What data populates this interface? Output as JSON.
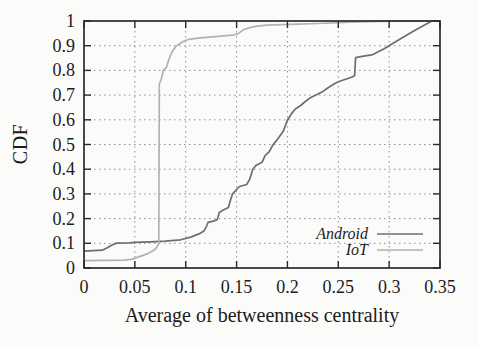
{
  "figure": {
    "background": "#fbfbfa"
  },
  "chart_data": {
    "type": "line",
    "subtype": "cdf-step-curves",
    "title": "",
    "xlabel": "Average of betweenness centrality",
    "ylabel": "CDF",
    "xlim": [
      0,
      0.35
    ],
    "ylim": [
      0,
      1
    ],
    "x_ticks": [
      0,
      0.05,
      0.1,
      0.15,
      0.2,
      0.25,
      0.3,
      0.35
    ],
    "x_tick_labels": [
      "0",
      "0.05",
      "0.1",
      "0.15",
      "0.2",
      "0.25",
      "0.3",
      "0.35"
    ],
    "y_ticks": [
      0,
      0.1,
      0.2,
      0.3,
      0.4,
      0.5,
      0.6,
      0.7,
      0.8,
      0.9,
      1
    ],
    "y_tick_labels": [
      "0",
      "0.1",
      "0.2",
      "0.3",
      "0.4",
      "0.5",
      "0.6",
      "0.7",
      "0.8",
      "0.9",
      "1"
    ],
    "grid": true,
    "grid_style": "dotted",
    "legend_position": "inside-lower-right",
    "frame_color": "#2b2b2b",
    "grid_color": "#8f8f8f",
    "legend": {
      "entries": [
        {
          "label": "Android"
        },
        {
          "label": "IoT"
        }
      ]
    },
    "series": [
      {
        "name": "Android",
        "color": "#6e6e6e",
        "points": [
          [
            0,
            0.068
          ],
          [
            0.018,
            0.072
          ],
          [
            0.023,
            0.082
          ],
          [
            0.027,
            0.092
          ],
          [
            0.032,
            0.101
          ],
          [
            0.045,
            0.102
          ],
          [
            0.05,
            0.104
          ],
          [
            0.065,
            0.106
          ],
          [
            0.08,
            0.109
          ],
          [
            0.095,
            0.114
          ],
          [
            0.105,
            0.125
          ],
          [
            0.113,
            0.138
          ],
          [
            0.118,
            0.15
          ],
          [
            0.12,
            0.165
          ],
          [
            0.122,
            0.185
          ],
          [
            0.127,
            0.19
          ],
          [
            0.131,
            0.195
          ],
          [
            0.133,
            0.225
          ],
          [
            0.137,
            0.235
          ],
          [
            0.142,
            0.245
          ],
          [
            0.144,
            0.275
          ],
          [
            0.146,
            0.3
          ],
          [
            0.15,
            0.318
          ],
          [
            0.153,
            0.33
          ],
          [
            0.16,
            0.338
          ],
          [
            0.163,
            0.36
          ],
          [
            0.166,
            0.4
          ],
          [
            0.169,
            0.415
          ],
          [
            0.175,
            0.428
          ],
          [
            0.178,
            0.455
          ],
          [
            0.182,
            0.47
          ],
          [
            0.186,
            0.5
          ],
          [
            0.19,
            0.52
          ],
          [
            0.196,
            0.555
          ],
          [
            0.2,
            0.598
          ],
          [
            0.204,
            0.625
          ],
          [
            0.208,
            0.645
          ],
          [
            0.213,
            0.658
          ],
          [
            0.217,
            0.672
          ],
          [
            0.222,
            0.688
          ],
          [
            0.228,
            0.7
          ],
          [
            0.235,
            0.715
          ],
          [
            0.24,
            0.73
          ],
          [
            0.247,
            0.748
          ],
          [
            0.252,
            0.757
          ],
          [
            0.258,
            0.765
          ],
          [
            0.263,
            0.772
          ],
          [
            0.266,
            0.778
          ],
          [
            0.267,
            0.852
          ],
          [
            0.272,
            0.856
          ],
          [
            0.278,
            0.86
          ],
          [
            0.284,
            0.864
          ],
          [
            0.295,
            0.888
          ],
          [
            0.31,
            0.925
          ],
          [
            0.325,
            0.962
          ],
          [
            0.342,
            1.0
          ],
          [
            0.35,
            1.0
          ]
        ]
      },
      {
        "name": "IoT",
        "color": "#b2b2b2",
        "points": [
          [
            0,
            0.03
          ],
          [
            0.04,
            0.032
          ],
          [
            0.048,
            0.036
          ],
          [
            0.053,
            0.044
          ],
          [
            0.058,
            0.051
          ],
          [
            0.062,
            0.057
          ],
          [
            0.066,
            0.066
          ],
          [
            0.069,
            0.073
          ],
          [
            0.071,
            0.08
          ],
          [
            0.073,
            0.095
          ],
          [
            0.0735,
            0.1
          ],
          [
            0.074,
            0.745
          ],
          [
            0.076,
            0.765
          ],
          [
            0.077,
            0.78
          ],
          [
            0.078,
            0.8
          ],
          [
            0.081,
            0.812
          ],
          [
            0.083,
            0.838
          ],
          [
            0.085,
            0.862
          ],
          [
            0.087,
            0.878
          ],
          [
            0.09,
            0.895
          ],
          [
            0.094,
            0.908
          ],
          [
            0.098,
            0.918
          ],
          [
            0.103,
            0.926
          ],
          [
            0.11,
            0.93
          ],
          [
            0.12,
            0.934
          ],
          [
            0.135,
            0.939
          ],
          [
            0.148,
            0.944
          ],
          [
            0.152,
            0.95
          ],
          [
            0.157,
            0.965
          ],
          [
            0.162,
            0.972
          ],
          [
            0.17,
            0.979
          ],
          [
            0.18,
            0.983
          ],
          [
            0.195,
            0.985
          ],
          [
            0.21,
            0.987
          ],
          [
            0.23,
            0.99
          ],
          [
            0.25,
            0.993
          ],
          [
            0.27,
            0.996
          ],
          [
            0.3,
            0.999
          ],
          [
            0.35,
            1.0
          ]
        ]
      }
    ]
  }
}
